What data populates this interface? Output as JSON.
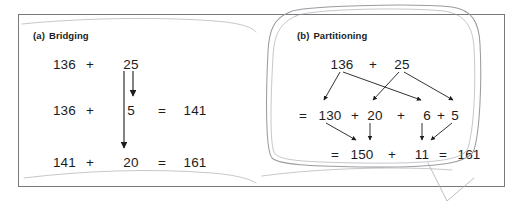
{
  "figure": {
    "panels": [
      {
        "id": "a",
        "tag": "(a)",
        "title": "Bridging",
        "rows": [
          {
            "left": "136",
            "op": "+",
            "right": "25",
            "eq": "",
            "result": ""
          },
          {
            "left": "136",
            "op": "+",
            "right": "5",
            "eq": "=",
            "result": "141"
          },
          {
            "left": "141",
            "op": "+",
            "right": "20",
            "eq": "=",
            "result": "161"
          }
        ],
        "arrows": [
          {
            "from": "25",
            "to": "5",
            "direction": "down"
          },
          {
            "from": "25",
            "to": "20",
            "direction": "down"
          }
        ]
      },
      {
        "id": "b",
        "tag": "(b)",
        "title": "Partitioning",
        "top_row": {
          "left": "136",
          "op": "+",
          "right": "25"
        },
        "middle_row": {
          "eq": "=",
          "terms": [
            "130",
            "20",
            "6",
            "5"
          ],
          "ops": [
            "+",
            "+",
            "+"
          ]
        },
        "bottom_row": {
          "eq": "=",
          "first": "150",
          "op": "+",
          "second": "11",
          "eq2": "=",
          "total": "161"
        },
        "arrows": [
          {
            "from": "136",
            "to": "130"
          },
          {
            "from": "136",
            "to": "6"
          },
          {
            "from": "25",
            "to": "20"
          },
          {
            "from": "25",
            "to": "5"
          },
          {
            "from": "130",
            "to": "150"
          },
          {
            "from": "20",
            "to": "150"
          },
          {
            "from": "6",
            "to": "11"
          },
          {
            "from": "5",
            "to": "11"
          }
        ]
      }
    ],
    "annotations": {
      "hand_drawn_ring": "rounded-rectangle-around-panel-b",
      "hand_drawn_mark": "v-shaped-pencil-mark-below-frame",
      "ink_color": "#8e9094"
    }
  }
}
